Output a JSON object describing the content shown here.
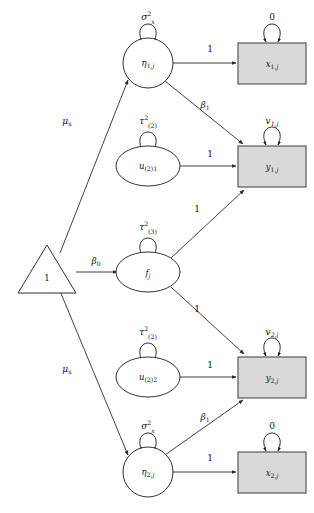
{
  "diagram": {
    "type": "path-diagram",
    "canvas": {
      "width": 314,
      "height": 513
    },
    "colors": {
      "observed_fill": "#d9d9d9",
      "latent_fill": "#ffffff",
      "stroke": "#1a1a1a",
      "background": "#ffffff"
    },
    "nodes": [
      {
        "id": "constant",
        "shape": "triangle",
        "kind": "constant",
        "label": "1",
        "label_style": "upright",
        "cx": 47,
        "cy": 272
      },
      {
        "id": "eta1",
        "shape": "circle",
        "kind": "latent",
        "label_main": "η",
        "label_sub": "1,",
        "label_sub_italic": "j",
        "cx": 148,
        "cy": 63
      },
      {
        "id": "u21",
        "shape": "ellipse",
        "kind": "latent",
        "label_main": "u",
        "label_sub": "(2)1",
        "cx": 148,
        "cy": 166
      },
      {
        "id": "fj",
        "shape": "ellipse",
        "kind": "latent",
        "label_main": "f",
        "label_sub_italic": "j",
        "cx": 148,
        "cy": 272
      },
      {
        "id": "u22",
        "shape": "ellipse",
        "kind": "latent",
        "label_main": "u",
        "label_sub": "(2)2",
        "cx": 148,
        "cy": 377
      },
      {
        "id": "eta2",
        "shape": "circle",
        "kind": "latent",
        "label_main": "η",
        "label_sub": "2,",
        "label_sub_italic": "j",
        "cx": 148,
        "cy": 472
      },
      {
        "id": "x1j",
        "shape": "rectangle",
        "kind": "observed",
        "label_main": "x",
        "label_sub": "1,",
        "label_sub_italic": "j",
        "cx": 272,
        "cy": 63
      },
      {
        "id": "y1j",
        "shape": "rectangle",
        "kind": "observed",
        "label_main": "y",
        "label_sub": "1,",
        "label_sub_italic": "j",
        "cx": 272,
        "cy": 166
      },
      {
        "id": "y2j",
        "shape": "rectangle",
        "kind": "observed",
        "label_main": "y",
        "label_sub": "2,",
        "label_sub_italic": "j",
        "cx": 272,
        "cy": 377
      },
      {
        "id": "x2j",
        "shape": "rectangle",
        "kind": "observed",
        "label_main": "x",
        "label_sub": "2,",
        "label_sub_italic": "j",
        "cx": 272,
        "cy": 472
      }
    ],
    "variance_labels": [
      {
        "id": "var-eta1",
        "node": "eta1",
        "main": "σ",
        "sup": "2",
        "sub": "x",
        "x": 148,
        "y": 20
      },
      {
        "id": "var-x1j",
        "node": "x1j",
        "main": "0",
        "sup": "",
        "sub": "",
        "x": 272,
        "y": 20
      },
      {
        "id": "var-u21",
        "node": "u21",
        "main": "τ",
        "sup": "2",
        "sub": "(2)",
        "x": 148,
        "y": 124
      },
      {
        "id": "var-y1j",
        "node": "y1j",
        "main": "v",
        "sup": "",
        "sub": "1,j",
        "x": 272,
        "y": 124
      },
      {
        "id": "var-fj",
        "node": "fj",
        "main": "τ",
        "sup": "2",
        "sub": "(3)",
        "x": 148,
        "y": 230
      },
      {
        "id": "var-u22",
        "node": "u22",
        "main": "τ",
        "sup": "2",
        "sub": "(2)",
        "x": 148,
        "y": 335
      },
      {
        "id": "var-y2j",
        "node": "y2j",
        "main": "v",
        "sup": "",
        "sub": "2,j",
        "x": 272,
        "y": 335
      },
      {
        "id": "var-eta2",
        "node": "eta2",
        "main": "σ",
        "sup": "2",
        "sub": "x",
        "x": 148,
        "y": 429
      },
      {
        "id": "var-x2j",
        "node": "x2j",
        "main": "0",
        "sup": "",
        "sub": "",
        "x": 272,
        "y": 429
      }
    ],
    "edges": [
      {
        "id": "edge-eta1-x1j",
        "from": "eta1",
        "to": "x1j",
        "label": "1",
        "label_style": "upright",
        "lx": 210,
        "ly": 52
      },
      {
        "id": "edge-eta1-y1j",
        "from": "eta1",
        "to": "y1j",
        "label": "β",
        "label_sub": "1",
        "label_style": "italic",
        "lx": 205,
        "ly": 108
      },
      {
        "id": "edge-u21-y1j",
        "from": "u21",
        "to": "y1j",
        "label": "1",
        "label_style": "upright",
        "lx": 210,
        "ly": 157
      },
      {
        "id": "edge-fj-y1j",
        "from": "fj",
        "to": "y1j",
        "label": "1",
        "label_style": "upright",
        "lx": 197,
        "ly": 212
      },
      {
        "id": "edge-constant-fj",
        "from": "constant",
        "to": "fj",
        "label": "β",
        "label_sub": "0",
        "label_style": "italic",
        "lx": 96,
        "ly": 264
      },
      {
        "id": "edge-constant-eta1",
        "from": "constant",
        "to": "eta1",
        "label": "μ",
        "label_sub": "x",
        "label_style": "italic",
        "lx": 67,
        "ly": 124
      },
      {
        "id": "edge-constant-eta2",
        "from": "constant",
        "to": "eta2",
        "label": "μ",
        "label_sub": "x",
        "label_style": "italic",
        "lx": 67,
        "ly": 372
      },
      {
        "id": "edge-fj-y2j",
        "from": "fj",
        "to": "y2j",
        "label": "1",
        "label_style": "upright",
        "lx": 197,
        "ly": 312
      },
      {
        "id": "edge-u22-y2j",
        "from": "u22",
        "to": "y2j",
        "label": "1",
        "label_style": "upright",
        "lx": 210,
        "ly": 368
      },
      {
        "id": "edge-eta2-y2j",
        "from": "eta2",
        "to": "y2j",
        "label": "β",
        "label_sub": "1",
        "label_style": "italic",
        "lx": 205,
        "ly": 420
      },
      {
        "id": "edge-eta2-x2j",
        "from": "eta2",
        "to": "x2j",
        "label": "1",
        "label_style": "upright",
        "lx": 210,
        "ly": 461
      }
    ]
  }
}
